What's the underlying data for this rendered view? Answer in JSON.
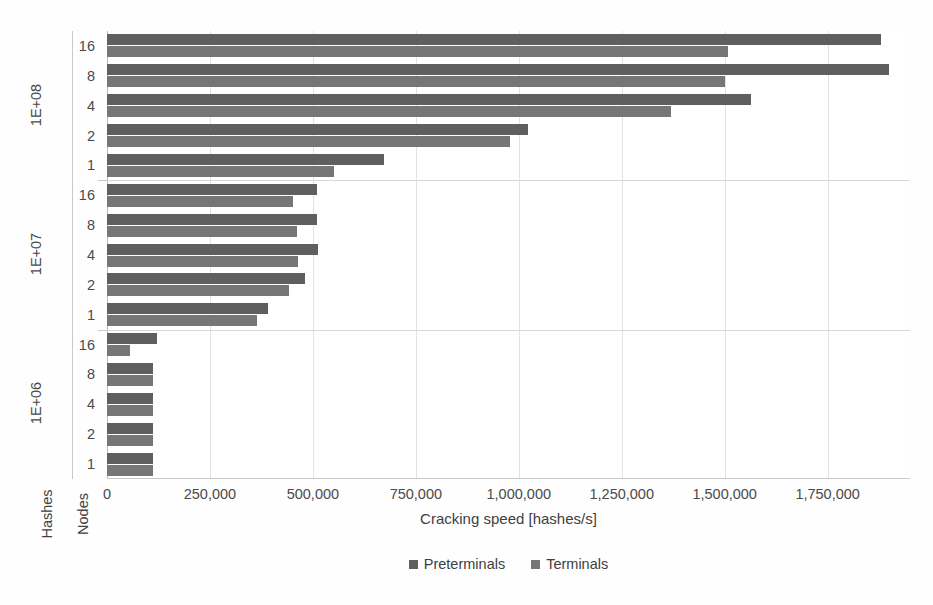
{
  "chart_data": {
    "type": "bar",
    "orientation": "horizontal",
    "title": "",
    "xlabel": "Cracking speed [hashes/s]",
    "ylabel": "",
    "y_outer_label": "Hashes",
    "y_inner_label": "Nodes",
    "xlim": [
      0,
      1950000
    ],
    "xticks": [
      0,
      250000,
      500000,
      750000,
      1000000,
      1250000,
      1500000,
      1750000
    ],
    "xticklabels": [
      "0",
      "250,000",
      "500,000",
      "750,000",
      "1,000,000",
      "1,250,000",
      "1,500,000",
      "1,750,000"
    ],
    "grid": "vertical",
    "legend_position": "bottom",
    "series": [
      {
        "name": "Preterminals",
        "color": "#5f5f5f"
      },
      {
        "name": "Terminals",
        "color": "#767676"
      }
    ],
    "groups": [
      {
        "label": "1E+08",
        "categories": [
          "16",
          "8",
          "4",
          "2",
          "1"
        ],
        "values": {
          "Preterminals": [
            1880000,
            1900000,
            1565000,
            1022000,
            672000
          ],
          "Terminals": [
            1507000,
            1500000,
            1370000,
            978000,
            551000
          ]
        }
      },
      {
        "label": "1E+07",
        "categories": [
          "16",
          "8",
          "4",
          "2",
          "1"
        ],
        "values": {
          "Preterminals": [
            510000,
            510000,
            512000,
            481000,
            391000
          ],
          "Terminals": [
            451000,
            461000,
            463000,
            442000,
            364000
          ]
        }
      },
      {
        "label": "1E+06",
        "categories": [
          "16",
          "8",
          "4",
          "2",
          "1"
        ],
        "values": {
          "Preterminals": [
            121000,
            112000,
            112000,
            112000,
            112000
          ],
          "Terminals": [
            56000,
            112000,
            112000,
            112000,
            112000
          ]
        }
      }
    ]
  },
  "legend": {
    "items": [
      {
        "label": "Preterminals",
        "color": "#5f5f5f"
      },
      {
        "label": "Terminals",
        "color": "#767676"
      }
    ]
  },
  "axes": {
    "x_title": "Cracking speed [hashes/s]",
    "hashes_title": "Hashes",
    "nodes_title": "Nodes"
  }
}
